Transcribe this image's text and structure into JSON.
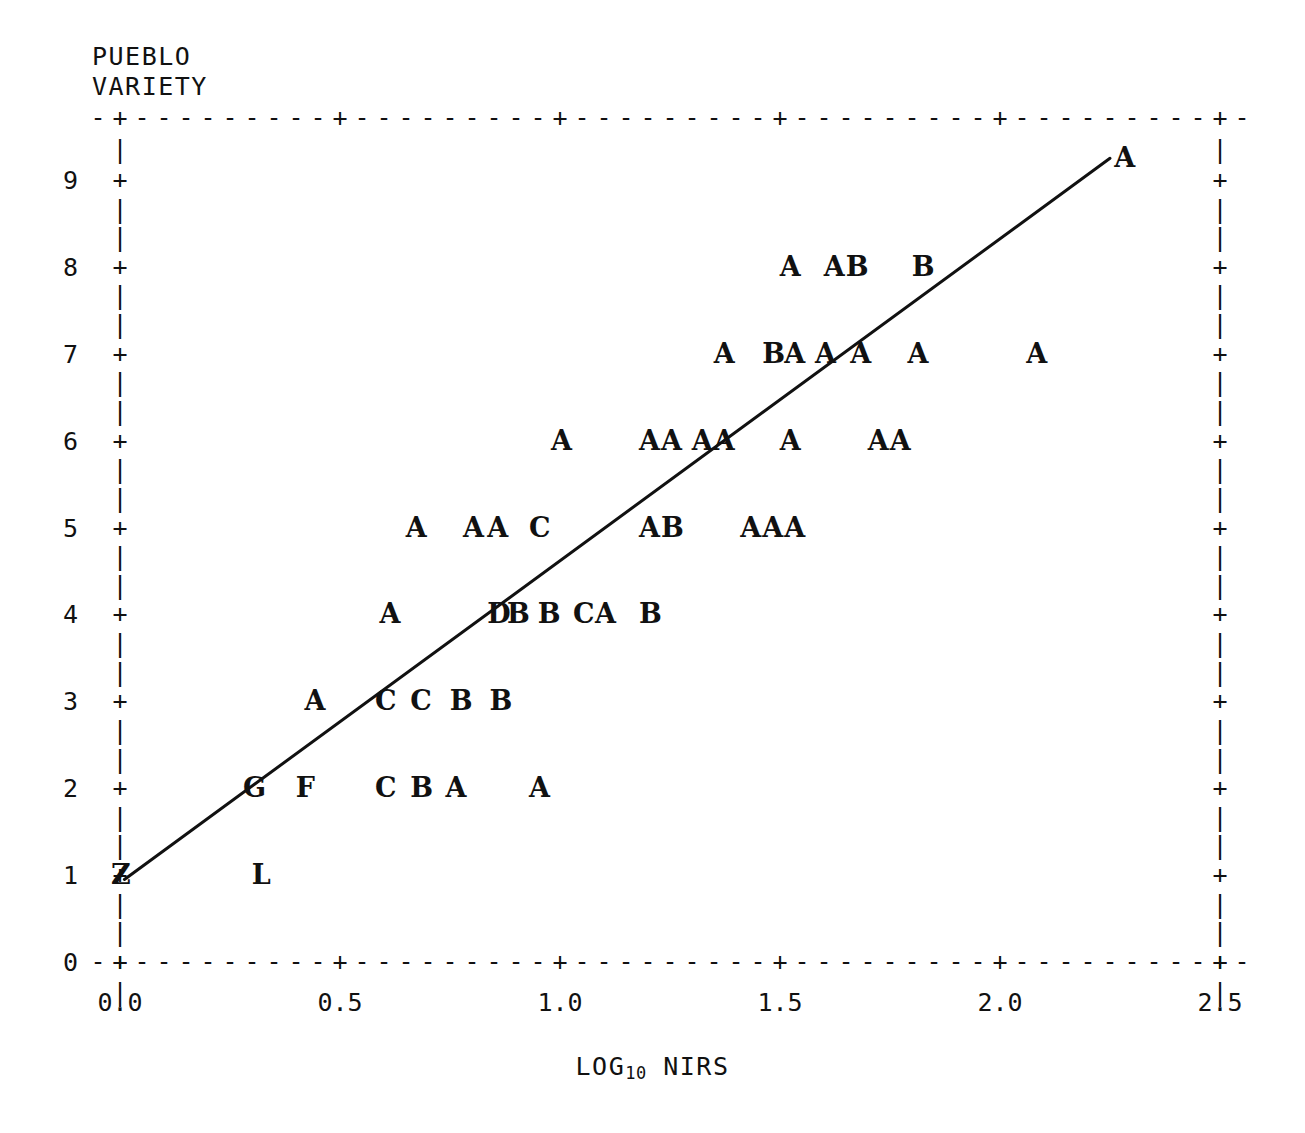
{
  "chart_data": {
    "type": "scatter",
    "title": "",
    "xlabel": "LOG10 NIRS",
    "xlabel_base": "LOG",
    "xlabel_sub": "10",
    "xlabel_rest": " NIRS",
    "ylabel": "PUEBLO VARIETY",
    "ylabel_line1": "PUEBLO",
    "ylabel_line2": "VARIETY",
    "xlim": [
      0.0,
      2.5
    ],
    "ylim": [
      0,
      9.6
    ],
    "xticks": [
      0.0,
      0.5,
      1.0,
      1.5,
      2.0,
      2.5
    ],
    "xtick_labels": [
      "0.0",
      "0.5",
      "1.0",
      "1.5",
      "2.0",
      "2.5"
    ],
    "yticks": [
      0,
      1,
      2,
      3,
      4,
      5,
      6,
      7,
      8,
      9
    ],
    "ytick_labels": [
      "0",
      "1",
      "2",
      "3",
      "4",
      "5",
      "6",
      "7",
      "8",
      "9"
    ],
    "grid": false,
    "legend": "none",
    "marker_style": "letter-code",
    "marker_note": "Letters encode number of coincident observations: A=1, B=2, C=3, D=4, F=6, G=7, L=12, Z=26",
    "points": [
      {
        "label": "Z",
        "x": 0.0,
        "y": 1
      },
      {
        "label": "L",
        "x": 0.32,
        "y": 1
      },
      {
        "label": "G",
        "x": 0.3,
        "y": 2
      },
      {
        "label": "F",
        "x": 0.42,
        "y": 2
      },
      {
        "label": "C",
        "x": 0.6,
        "y": 2
      },
      {
        "label": "B",
        "x": 0.68,
        "y": 2
      },
      {
        "label": "A",
        "x": 0.76,
        "y": 2
      },
      {
        "label": "A",
        "x": 0.95,
        "y": 2
      },
      {
        "label": "A",
        "x": 0.44,
        "y": 3
      },
      {
        "label": "C",
        "x": 0.6,
        "y": 3
      },
      {
        "label": "C",
        "x": 0.68,
        "y": 3
      },
      {
        "label": "B",
        "x": 0.77,
        "y": 3
      },
      {
        "label": "B",
        "x": 0.86,
        "y": 3
      },
      {
        "label": "A",
        "x": 0.61,
        "y": 4
      },
      {
        "label": "D",
        "x": 0.855,
        "y": 4
      },
      {
        "label": "B",
        "x": 0.9,
        "y": 4
      },
      {
        "label": "B",
        "x": 0.97,
        "y": 4
      },
      {
        "label": "C",
        "x": 1.05,
        "y": 4
      },
      {
        "label": "A",
        "x": 1.1,
        "y": 4
      },
      {
        "label": "B",
        "x": 1.2,
        "y": 4
      },
      {
        "label": "A",
        "x": 0.67,
        "y": 5
      },
      {
        "label": "A",
        "x": 0.8,
        "y": 5
      },
      {
        "label": "A",
        "x": 0.855,
        "y": 5
      },
      {
        "label": "C",
        "x": 0.95,
        "y": 5
      },
      {
        "label": "A",
        "x": 1.2,
        "y": 5
      },
      {
        "label": "B",
        "x": 1.25,
        "y": 5
      },
      {
        "label": "A",
        "x": 1.43,
        "y": 5
      },
      {
        "label": "A",
        "x": 1.48,
        "y": 5
      },
      {
        "label": "A",
        "x": 1.53,
        "y": 5
      },
      {
        "label": "A",
        "x": 1.0,
        "y": 6
      },
      {
        "label": "A",
        "x": 1.2,
        "y": 6
      },
      {
        "label": "A",
        "x": 1.25,
        "y": 6
      },
      {
        "label": "A",
        "x": 1.32,
        "y": 6
      },
      {
        "label": "A",
        "x": 1.37,
        "y": 6
      },
      {
        "label": "A",
        "x": 1.52,
        "y": 6
      },
      {
        "label": "A",
        "x": 1.72,
        "y": 6
      },
      {
        "label": "A",
        "x": 1.77,
        "y": 6
      },
      {
        "label": "A",
        "x": 1.37,
        "y": 7
      },
      {
        "label": "B",
        "x": 1.48,
        "y": 7
      },
      {
        "label": "A",
        "x": 1.53,
        "y": 7
      },
      {
        "label": "A",
        "x": 1.6,
        "y": 7
      },
      {
        "label": "A",
        "x": 1.68,
        "y": 7
      },
      {
        "label": "A",
        "x": 1.81,
        "y": 7
      },
      {
        "label": "A",
        "x": 2.08,
        "y": 7
      },
      {
        "label": "A",
        "x": 1.52,
        "y": 8
      },
      {
        "label": "A",
        "x": 1.62,
        "y": 8
      },
      {
        "label": "B",
        "x": 1.67,
        "y": 8
      },
      {
        "label": "B",
        "x": 1.82,
        "y": 8
      },
      {
        "label": "A",
        "x": 2.28,
        "y": 9.25
      }
    ],
    "fit_line": {
      "label": "regression-line",
      "x0": 0.01,
      "y0": 0.95,
      "x1": 2.25,
      "y1": 9.25
    }
  },
  "frame": {
    "tick_glyph": "+",
    "vertical_glyph": "|",
    "dash_glyph": "-"
  }
}
